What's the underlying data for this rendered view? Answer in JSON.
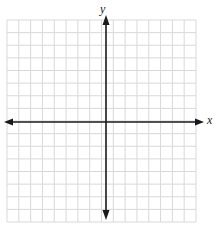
{
  "diagram": {
    "type": "coordinate-plane",
    "axes": {
      "x_label": "x",
      "y_label": "y"
    },
    "grid": {
      "columns": 16,
      "rows": 16,
      "left": 7,
      "top": 20,
      "right": 196,
      "bottom": 222,
      "line_color": "#d9d9d9"
    },
    "axis_position": {
      "x_axis_y": 122,
      "y_axis_x": 106
    },
    "axis_color": "#1a1a1a"
  }
}
